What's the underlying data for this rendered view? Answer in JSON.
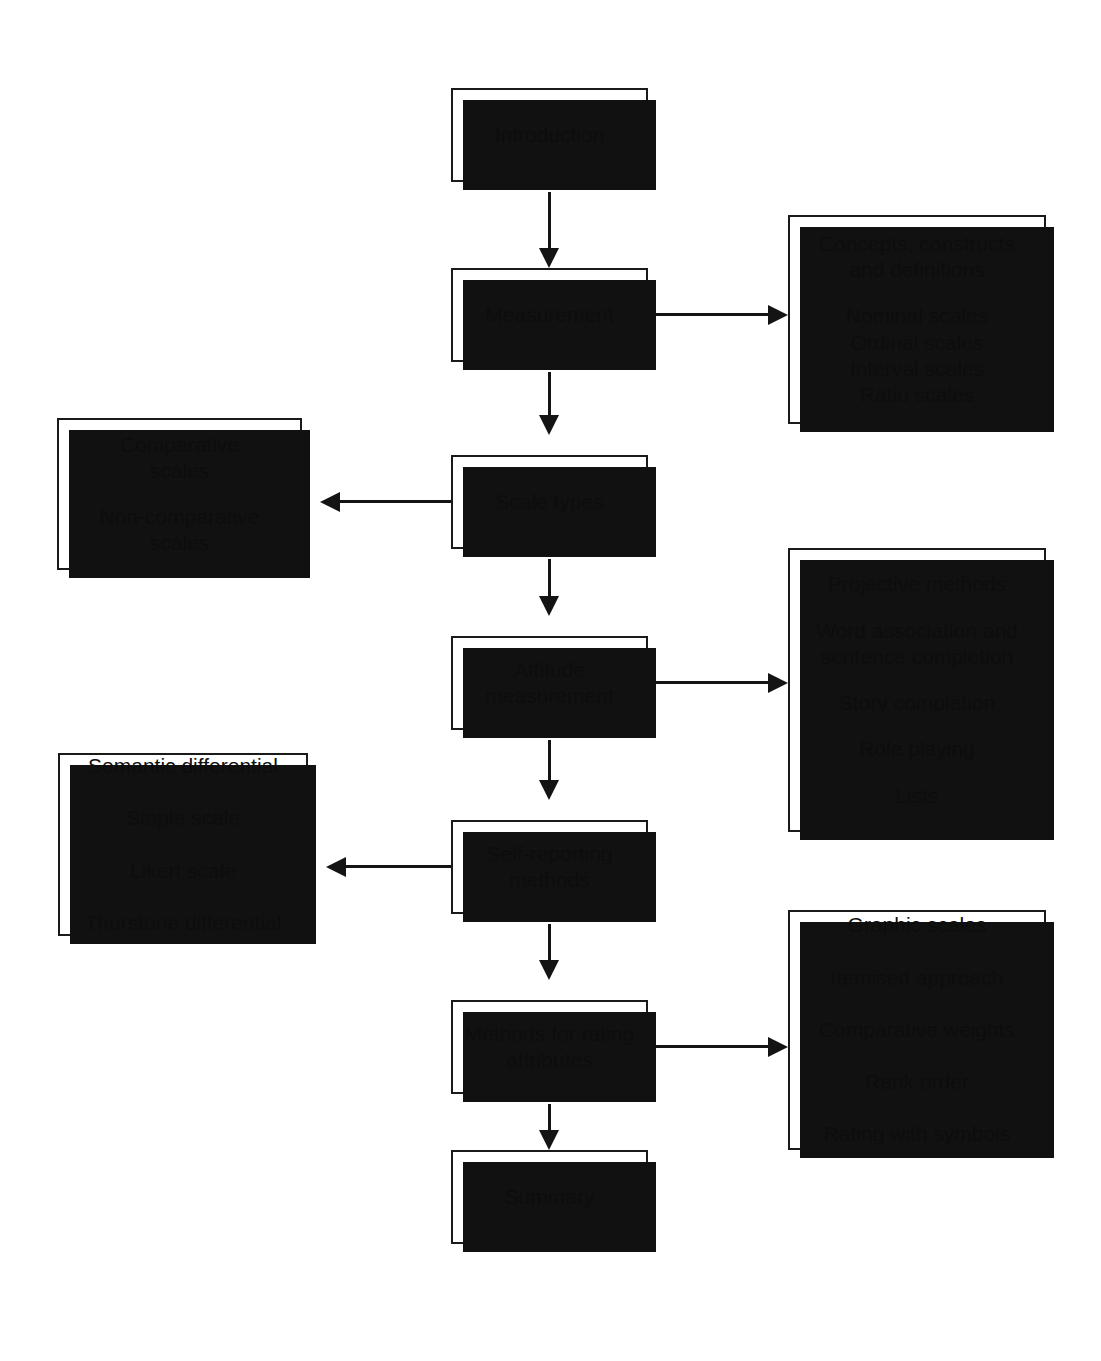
{
  "diagram": {
    "style": {
      "box_fill": "#ffffff",
      "box_border": "#1a1a1a",
      "shadow": "#111111",
      "connector": "#141414",
      "text": "#0d0d0d",
      "background": "#ffffff"
    },
    "main_flow": [
      {
        "id": "introduction",
        "label": "Introduction"
      },
      {
        "id": "measurement",
        "label": "Measurement"
      },
      {
        "id": "scale-types",
        "label": "Scale types"
      },
      {
        "id": "attitude-measurement",
        "line1": "Attitude",
        "line2": "measurement"
      },
      {
        "id": "self-reporting-methods",
        "line1": "Self-reporting",
        "line2": "methods"
      },
      {
        "id": "methods-for-rating-attributes",
        "line1": "Methods for rating",
        "line2": "attributes"
      },
      {
        "id": "summary",
        "label": "Summary"
      }
    ],
    "detail_boxes": {
      "measurement_details": {
        "id": "measurement-details",
        "side": "right",
        "group_a": [
          "Concepts, constructs",
          "and definitions"
        ],
        "group_b": [
          "Nominal scales",
          "Ordinal scales",
          "Interval scales",
          "Ratio scales"
        ]
      },
      "scale_types_details": {
        "id": "scale-types-details",
        "side": "left",
        "group_a": [
          "Comparative",
          "scales"
        ],
        "group_b": [
          "Non-comparative",
          "scales"
        ]
      },
      "attitude_details": {
        "id": "attitude-measurement-details",
        "side": "right",
        "items": [
          "Projective methods",
          "Word association and",
          "sentence completion",
          "Story completion",
          "Role playing",
          "Lists"
        ]
      },
      "self_reporting_details": {
        "id": "self-reporting-details",
        "side": "left",
        "items": [
          "Semantic differential",
          "Staple scale",
          "Likert scale",
          "Thurstone differential"
        ]
      },
      "rating_details": {
        "id": "rating-attributes-details",
        "side": "right",
        "items": [
          "Graphic scales",
          "Itemised approach",
          "Comparative weights",
          "Rank order",
          "Rating with symbols"
        ]
      }
    }
  }
}
